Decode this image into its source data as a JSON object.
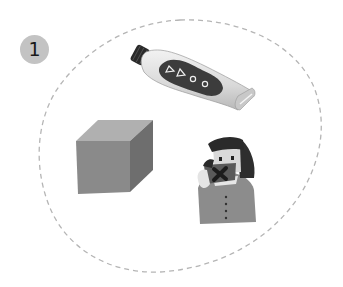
{
  "figure": {
    "step_number": "1",
    "outline": {
      "style": "dashed",
      "color": "#b5b5b5"
    },
    "objects": [
      {
        "name": "lotion-tube",
        "description": "grey tube with dark control panel showing two triangles and two circles"
      },
      {
        "name": "cube",
        "description": "grey shaded cube"
      },
      {
        "name": "person",
        "description": "girl with dark bob haircut holding a card with an X mark"
      }
    ]
  },
  "colors": {
    "badge_bg": "#c3c3c3",
    "badge_text": "#1a1a1a",
    "dash": "#b5b5b5",
    "cube_front": "#8a8a8a",
    "cube_top": "#b0b0b0",
    "cube_side": "#6e6e6e"
  }
}
